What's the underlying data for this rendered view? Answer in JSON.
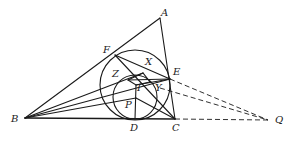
{
  "figure": {
    "type": "geometry-diagram",
    "stroke_color": "#1a1a1a",
    "background": "#ffffff"
  },
  "points": {
    "A": {
      "label": "A",
      "x": 160,
      "y": 18
    },
    "B": {
      "label": "B",
      "x": 25,
      "y": 118
    },
    "C": {
      "label": "C",
      "x": 175,
      "y": 119
    },
    "D": {
      "label": "D",
      "x": 135,
      "y": 119
    },
    "E": {
      "label": "E",
      "x": 170,
      "y": 79
    },
    "F": {
      "label": "F",
      "x": 115,
      "y": 55
    },
    "Z": {
      "label": "Z",
      "x": 128,
      "y": 78
    },
    "I": {
      "label": "I",
      "x": 136,
      "y": 83
    },
    "P": {
      "label": "P",
      "x": 136,
      "y": 98
    },
    "X": {
      "label": "X",
      "x": 148,
      "y": 67
    },
    "Y": {
      "label": "Y",
      "x": 156,
      "y": 85
    },
    "Q": {
      "label": "Q",
      "x": 270,
      "y": 120
    }
  },
  "labels": {
    "A": "A",
    "B": "B",
    "C": "C",
    "D": "D",
    "E": "E",
    "F": "F",
    "Z": "Z",
    "I": "I",
    "P": "P",
    "X": "X",
    "Y": "Y",
    "Q": "Q"
  },
  "circles": [
    {
      "name": "large-circle",
      "cx": 135,
      "cy": 85,
      "r": 35
    },
    {
      "name": "incircle",
      "cx": 135,
      "cy": 97,
      "r": 22
    }
  ],
  "dashed_lines": [
    "E-Q",
    "Y-Q",
    "C-Q"
  ]
}
